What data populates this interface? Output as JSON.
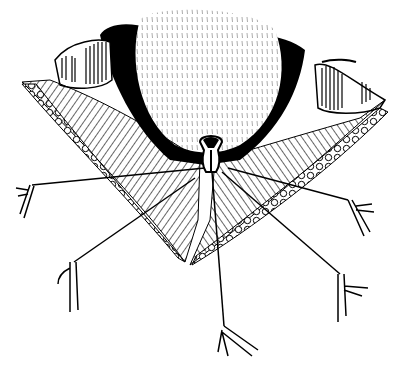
{
  "figure": {
    "colors": {
      "ink": "#000000",
      "paper": "#ffffff"
    },
    "sutures": [
      {
        "name": "left-upper",
        "anchor": [
          30,
          186
        ],
        "origin": [
          205,
          168
        ]
      },
      {
        "name": "left-lower",
        "anchor": [
          72,
          262
        ],
        "origin": [
          195,
          178
        ]
      },
      {
        "name": "bottom",
        "anchor": [
          225,
          330
        ],
        "origin": [
          212,
          172
        ]
      },
      {
        "name": "right-lower",
        "anchor": [
          340,
          276
        ],
        "origin": [
          222,
          172
        ]
      },
      {
        "name": "right-upper",
        "anchor": [
          352,
          200
        ],
        "origin": [
          228,
          168
        ]
      }
    ]
  }
}
